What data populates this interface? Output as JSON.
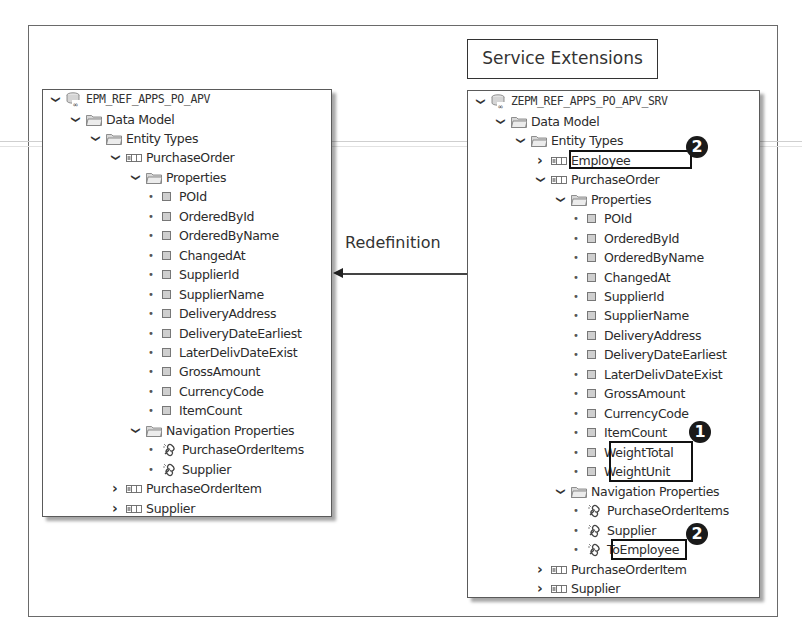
{
  "diagram": {
    "callout_label": "Service Extensions",
    "arrow_label": "Redefinition",
    "arrow_direction": "right-to-left"
  },
  "left_tree": {
    "root": "EPM_REF_APPS_PO_APV",
    "data_model": "Data Model",
    "entity_types": "Entity Types",
    "purchase_order": "PurchaseOrder",
    "properties_folder": "Properties",
    "properties": [
      "POId",
      "OrderedById",
      "OrderedByName",
      "ChangedAt",
      "SupplierId",
      "SupplierName",
      "DeliveryAddress",
      "DeliveryDateEarliest",
      "LaterDelivDateExist",
      "GrossAmount",
      "CurrencyCode",
      "ItemCount"
    ],
    "navigation_folder": "Navigation Properties",
    "navigation": [
      "PurchaseOrderItems",
      "Supplier"
    ],
    "other_entities": [
      "PurchaseOrderItem",
      "Supplier"
    ]
  },
  "right_tree": {
    "root": "ZEPM_REF_APPS_PO_APV_SRV",
    "data_model": "Data Model",
    "entity_types": "Entity Types",
    "employee": "Employee",
    "purchase_order": "PurchaseOrder",
    "properties_folder": "Properties",
    "properties": [
      "POId",
      "OrderedById",
      "OrderedByName",
      "ChangedAt",
      "SupplierId",
      "SupplierName",
      "DeliveryAddress",
      "DeliveryDateEarliest",
      "LaterDelivDateExist",
      "GrossAmount",
      "CurrencyCode",
      "ItemCount",
      "WeightTotal",
      "WeightUnit"
    ],
    "navigation_folder": "Navigation Properties",
    "navigation": [
      "PurchaseOrderItems",
      "Supplier",
      "ToEmployee"
    ],
    "other_entities": [
      "PurchaseOrderItem",
      "Supplier"
    ]
  },
  "badges": {
    "employee": "2",
    "weight": "1",
    "to_employee": "2"
  },
  "icons": {
    "expanded": "chevron-down",
    "collapsed": "chevron-right",
    "service": "odata-service",
    "folder": "folder-open",
    "entity": "entity-type",
    "property": "property-square",
    "navigation": "link-chain"
  }
}
